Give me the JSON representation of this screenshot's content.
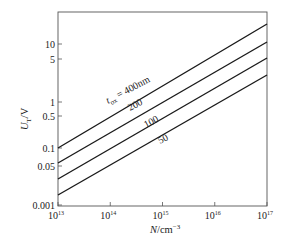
{
  "chart_data": {
    "type": "line",
    "title": "",
    "xlabel": "N/cm^-3",
    "ylabel": "U_T/V",
    "x_scale": "log",
    "y_scale": "log",
    "xlim": [
      10000000000000.0,
      1e+17
    ],
    "ylim": [
      0.01,
      30
    ],
    "grid": false,
    "legend": "inline labels on curves",
    "x_ticks": [
      {
        "value": 10000000000000.0,
        "base": "10",
        "exp": "13"
      },
      {
        "value": 100000000000000.0,
        "base": "10",
        "exp": "14"
      },
      {
        "value": 1000000000000000.0,
        "base": "10",
        "exp": "15"
      },
      {
        "value": 1e+16,
        "base": "10",
        "exp": "16"
      },
      {
        "value": 1e+17,
        "base": "10",
        "exp": "17"
      }
    ],
    "y_ticks": [
      {
        "label": "10",
        "py": 44
      },
      {
        "label": "5",
        "py": 59
      },
      {
        "label": "1",
        "py": 102
      },
      {
        "label": "0.5",
        "py": 116
      },
      {
        "label": "0.1",
        "py": 148
      },
      {
        "label": "0.05",
        "py": 166
      },
      {
        "label": "0.001",
        "py": 205
      }
    ],
    "x": [
      10000000000000.0,
      1e+17
    ],
    "series": [
      {
        "name": "t_ox = 400nm",
        "label": "400nm",
        "values": [
          0.1,
          22
        ],
        "px": [
          [
            58,
            148
          ],
          [
            267,
            24
          ]
        ]
      },
      {
        "name": "200",
        "label": "200",
        "values": [
          0.05,
          11
        ],
        "px": [
          [
            58,
            163
          ],
          [
            267,
            42
          ]
        ]
      },
      {
        "name": "100",
        "label": "100",
        "values": [
          0.025,
          5.7
        ],
        "px": [
          [
            58,
            179
          ],
          [
            267,
            58
          ]
        ]
      },
      {
        "name": "50",
        "label": "50",
        "values": [
          0.012,
          2.9
        ],
        "px": [
          [
            58,
            195
          ],
          [
            267,
            75
          ]
        ]
      }
    ]
  },
  "labels": {
    "ylabel_main": "U",
    "ylabel_sub": "T",
    "ylabel_unit": "/V",
    "xlabel_main": "N",
    "xlabel_unit": "/cm",
    "xlabel_exp": "−3",
    "curve_400_prefix": "t",
    "curve_400_sub": "ox",
    "curve_400_text": " = 400nm",
    "curve_200": "200",
    "curve_100": "100",
    "curve_50": "50"
  }
}
